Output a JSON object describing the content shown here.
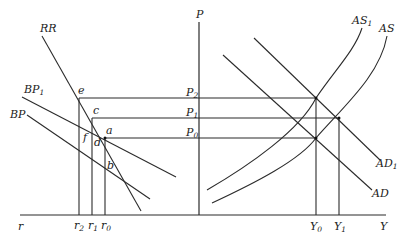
{
  "diagram": {
    "axes": {
      "vertical_label": "P",
      "left_horizontal_label": "r",
      "right_horizontal_label": "Y"
    },
    "curves": [
      {
        "id": "RR",
        "label": "RR",
        "sub": ""
      },
      {
        "id": "BP1",
        "label": "BP",
        "sub": "1"
      },
      {
        "id": "BP",
        "label": "BP",
        "sub": ""
      },
      {
        "id": "AS1",
        "label": "AS",
        "sub": "1"
      },
      {
        "id": "AS",
        "label": "AS",
        "sub": ""
      },
      {
        "id": "AD1",
        "label": "AD",
        "sub": "1"
      },
      {
        "id": "AD",
        "label": "AD",
        "sub": ""
      }
    ],
    "price_levels": [
      {
        "label": "P",
        "sub": "2"
      },
      {
        "label": "P",
        "sub": "1"
      },
      {
        "label": "P",
        "sub": "0"
      }
    ],
    "interest_rates": [
      {
        "label": "r",
        "sub": "2"
      },
      {
        "label": "r",
        "sub": "1"
      },
      {
        "label": "r",
        "sub": "0"
      }
    ],
    "outputs": [
      {
        "label": "Y",
        "sub": "0"
      },
      {
        "label": "Y",
        "sub": "1"
      }
    ],
    "points": [
      "e",
      "c",
      "a",
      "f",
      "d",
      "b"
    ]
  }
}
